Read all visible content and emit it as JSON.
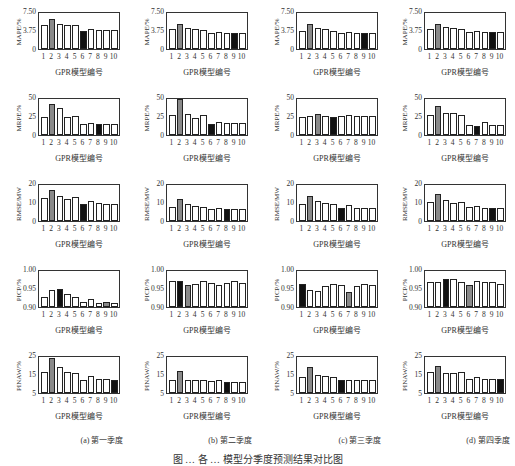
{
  "xlabel": "GPR模型编号",
  "x_categories": [
    "1",
    "2",
    "3",
    "4",
    "5",
    "6",
    "7",
    "8",
    "9",
    "10"
  ],
  "subcaptions": [
    "(a) 第一季度",
    "(b) 第二季度",
    "(c) 第三季度",
    "(d) 第四季度"
  ],
  "figure_caption": "图 … 各 … 模型分季度预测结果对比图",
  "colors": {
    "default": "#ffffff",
    "gray": "#8a8a8a",
    "black": "#111111",
    "axis": "#333333"
  },
  "chart_data": {
    "type": "bar",
    "layout": "grid 5 rows (metrics) x 4 columns (quarters)",
    "categories": [
      "1",
      "2",
      "3",
      "4",
      "5",
      "6",
      "7",
      "8",
      "9",
      "10"
    ],
    "xlabel": "GPR模型编号",
    "rows": [
      {
        "metric": "MAPE/%",
        "ylim": [
          0,
          7.5
        ],
        "yticks": [
          "0",
          "3.75",
          "7.50"
        ],
        "panels": [
          {
            "quarter": "(a) 第一季度",
            "values": [
              5.0,
              6.3,
              5.2,
              4.9,
              5.0,
              3.8,
              4.1,
              3.9,
              3.9,
              3.9
            ],
            "gray": 2,
            "black": 6
          },
          {
            "quarter": "(b) 第二季度",
            "values": [
              4.1,
              5.2,
              4.4,
              4.1,
              4.0,
              3.3,
              3.6,
              3.3,
              3.3,
              3.3
            ],
            "gray": 2,
            "black": 9
          },
          {
            "quarter": "(c) 第三季度",
            "values": [
              3.8,
              5.3,
              4.3,
              4.1,
              3.8,
              3.3,
              3.5,
              3.3,
              3.3,
              3.3
            ],
            "gray": 2,
            "black": 9
          },
          {
            "quarter": "(d) 第四季度",
            "values": [
              4.2,
              5.2,
              4.5,
              4.3,
              4.2,
              3.5,
              3.8,
              3.5,
              3.5,
              3.5
            ],
            "gray": 2,
            "black": 9
          }
        ]
      },
      {
        "metric": "MRPE/%",
        "ylim": [
          0,
          50
        ],
        "yticks": [
          "0",
          "25",
          "50"
        ],
        "panels": [
          {
            "quarter": "(a) 第一季度",
            "values": [
              25,
              43,
              37,
              25,
              26,
              15,
              17,
              15,
              15,
              15
            ],
            "gray": 2,
            "black": 8
          },
          {
            "quarter": "(b) 第二季度",
            "values": [
              28,
              50,
              29,
              24,
              28,
              15,
              18,
              16,
              16,
              16
            ],
            "gray": 2,
            "black": 6
          },
          {
            "quarter": "(c) 第三季度",
            "values": [
              25,
              27,
              29,
              27,
              25,
              27,
              28,
              27,
              27,
              27
            ],
            "gray": 3,
            "black": 5
          },
          {
            "quarter": "(d) 第四季度",
            "values": [
              28,
              40,
              31,
              31,
              28,
              14,
              13,
              18,
              14,
              14
            ],
            "gray": 2,
            "black": 7
          }
        ]
      },
      {
        "metric": "RMSE/MW",
        "ylim": [
          0,
          20
        ],
        "yticks": [
          "0",
          "10",
          "20"
        ],
        "panels": [
          {
            "quarter": "(a) 第一季度",
            "values": [
              13,
              17.5,
              14,
              12.5,
              13.5,
              9.5,
              11,
              10,
              9.5,
              9.5
            ],
            "gray": 2,
            "black": 6
          },
          {
            "quarter": "(b) 第二季度",
            "values": [
              8,
              12,
              9.5,
              8.5,
              8,
              6.5,
              7.5,
              6.5,
              6.5,
              6.5
            ],
            "gray": 2,
            "black": 8
          },
          {
            "quarter": "(c) 第三季度",
            "values": [
              9.5,
              14,
              11,
              10,
              9.5,
              7.5,
              9,
              7.5,
              7.5,
              7.5
            ],
            "gray": 2,
            "black": 6
          },
          {
            "quarter": "(d) 第四季度",
            "values": [
              10.5,
              15,
              11.5,
              10,
              10.5,
              8,
              8.5,
              7.5,
              7.5,
              7.5
            ],
            "gray": 2,
            "black": 9
          }
        ]
      },
      {
        "metric": "PICP/%",
        "ylim": [
          0.9,
          1.0
        ],
        "yticks": [
          "0.90",
          "0.95",
          "1.00"
        ],
        "panels": [
          {
            "quarter": "(a) 第一季度",
            "values": [
              0.928,
              0.946,
              0.951,
              0.936,
              0.928,
              0.914,
              0.921,
              0.911,
              0.913,
              0.912
            ],
            "gray": 9,
            "black": 3
          },
          {
            "quarter": "(b) 第二季度",
            "values": [
              0.971,
              0.971,
              0.96,
              0.963,
              0.971,
              0.968,
              0.96,
              0.968,
              0.972,
              0.968
            ],
            "gray": 3,
            "black": 2
          },
          {
            "quarter": "(c) 第三季度",
            "values": [
              0.964,
              0.946,
              0.945,
              0.957,
              0.963,
              0.96,
              0.942,
              0.959,
              0.963,
              0.961
            ],
            "gray": 7,
            "black": 1
          },
          {
            "quarter": "(d) 第四季度",
            "values": [
              0.97,
              0.97,
              0.978,
              0.978,
              0.97,
              0.96,
              0.973,
              0.97,
              0.97,
              0.965
            ],
            "gray": 6,
            "black": 3
          }
        ]
      },
      {
        "metric": "PINAW/%",
        "ylim": [
          5,
          25
        ],
        "yticks": [
          "5",
          "15",
          "25"
        ],
        "panels": [
          {
            "quarter": "(a) 第一季度",
            "values": [
              16.5,
              24.5,
              19.5,
              16.5,
              16,
              12.5,
              14.5,
              13,
              13,
              12.5
            ],
            "gray": 2,
            "black": 10
          },
          {
            "quarter": "(b) 第二季度",
            "values": [
              12.5,
              17.5,
              12,
              12.5,
              12.5,
              11.5,
              12,
              11,
              11,
              11
            ],
            "gray": 2,
            "black": 8
          },
          {
            "quarter": "(c) 第三季度",
            "values": [
              14,
              19.5,
              15,
              14.5,
              14,
              12,
              12,
              12,
              12,
              12
            ],
            "gray": 2,
            "black": 6
          },
          {
            "quarter": "(d) 第四季度",
            "values": [
              16.5,
              20,
              16,
              16,
              16.5,
              13,
              14,
              13,
              13,
              13
            ],
            "gray": 2,
            "black": 10
          }
        ]
      }
    ],
    "legend": "none; gray bar = worst model, black bar = best model (highlight)",
    "grid": false
  }
}
